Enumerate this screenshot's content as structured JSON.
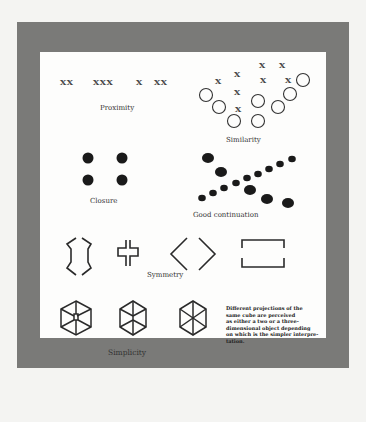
{
  "figure": {
    "principles": [
      {
        "name": "proximity",
        "label": "Proximity",
        "groups": [
          "XX",
          "XXX",
          "X",
          "XX"
        ]
      },
      {
        "name": "similarity",
        "label": "Similarity"
      },
      {
        "name": "closure",
        "label": "Closure"
      },
      {
        "name": "good-continuation",
        "label": "Good continuation"
      },
      {
        "name": "symmetry",
        "label": "Symmetry"
      },
      {
        "name": "simplicity",
        "label": "Simplicity"
      }
    ],
    "simplicity_note": [
      "Different projections of the",
      "same cube are perceived",
      "as either a two or a three-",
      "dimensional object depending",
      "on which is the simpler interpre-",
      "tation."
    ],
    "colors": {
      "frame": "#7a7a78",
      "panel": "#fdfdfc",
      "ink": "#222222",
      "background": "#f4f4f2"
    }
  }
}
